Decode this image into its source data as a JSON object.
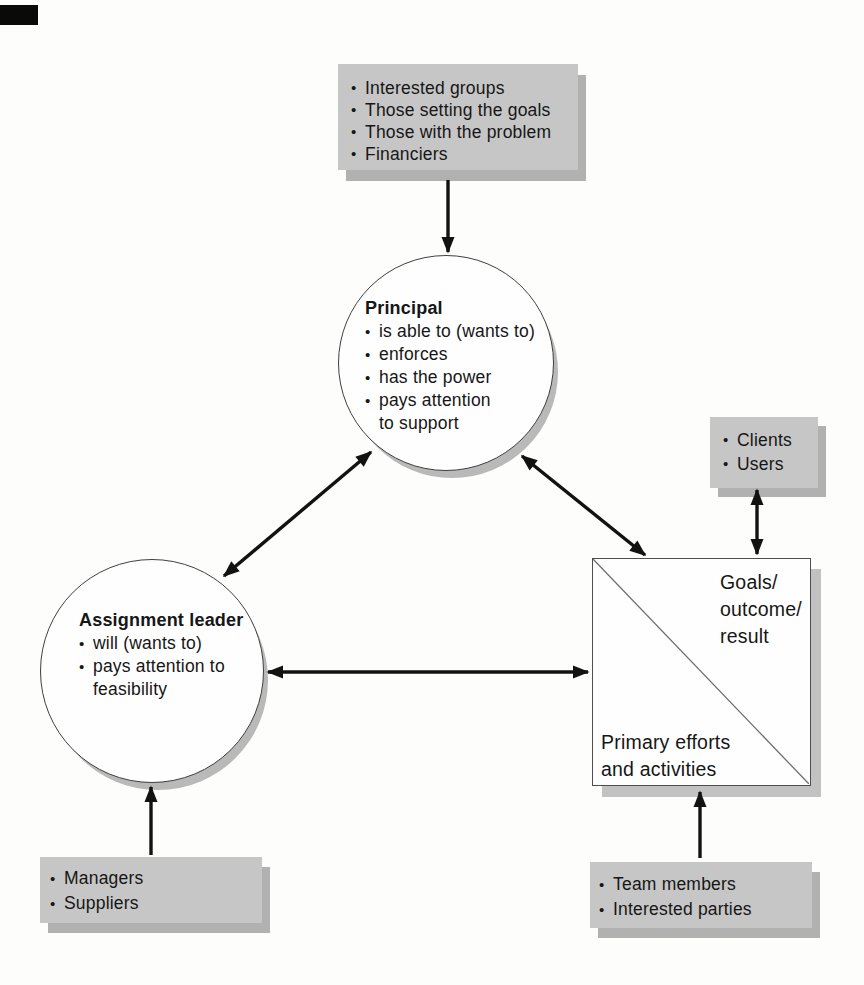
{
  "glyphs": {
    "bullet": "•"
  },
  "colors": {
    "background": "#fdfdfc",
    "box_fill": "#c6c6c6",
    "box_shadow": "#b1b1b1",
    "shape_shadow": "#bcbcbc",
    "ink": "#161616"
  },
  "top_box": {
    "items": [
      "Interested groups",
      "Those setting the goals",
      "Those with the problem",
      "Financiers"
    ]
  },
  "principal": {
    "title": "Principal",
    "items": [
      "is able to (wants to)",
      "enforces",
      "has the power",
      "pays attention\nto support"
    ]
  },
  "assignment_leader": {
    "title": "Assignment leader",
    "items": [
      "will (wants to)",
      "pays attention to\nfeasibility"
    ]
  },
  "clients_box": {
    "items": [
      "Clients",
      "Users"
    ]
  },
  "managers_box": {
    "items": [
      "Managers",
      "Suppliers"
    ]
  },
  "team_box": {
    "items": [
      "Team members",
      "Interested parties"
    ]
  },
  "square": {
    "top_right": "Goals/\noutcome/\nresult",
    "bottom_left": "Primary efforts\nand activities"
  }
}
